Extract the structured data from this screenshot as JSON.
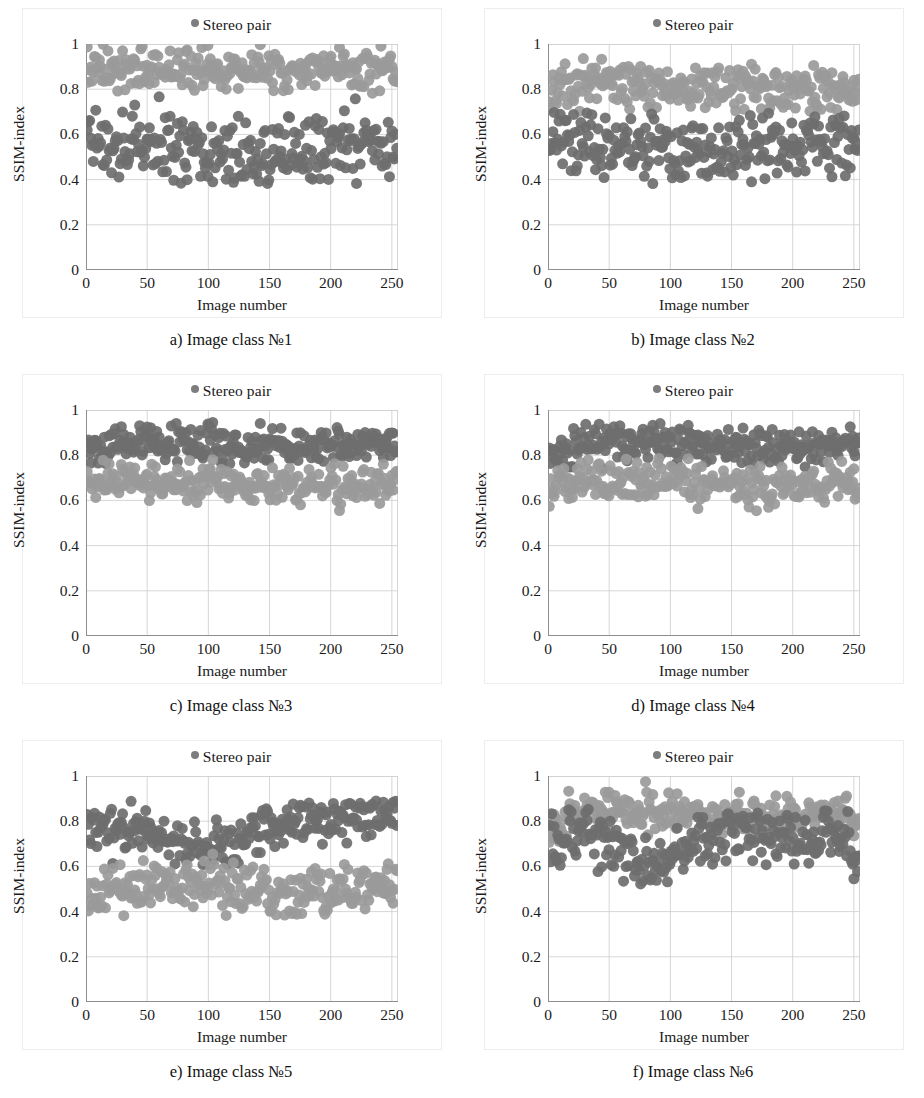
{
  "figure": {
    "panel_count": 6,
    "legend_label": "Stereo pair",
    "legend_marker_color": "#7d7d7d",
    "xlabel": "Image number",
    "ylabel": "SSIM-index",
    "yticks": [
      "0",
      "0.2",
      "0.4",
      "0.6",
      "0.8",
      "1"
    ],
    "xticks": [
      "0",
      "50",
      "100",
      "150",
      "200",
      "250"
    ]
  },
  "panels": [
    {
      "caption": "a) Image class №1",
      "key": "a"
    },
    {
      "caption": "b) Image class №2",
      "key": "b"
    },
    {
      "caption": "c) Image class №3",
      "key": "c"
    },
    {
      "caption": "d) Image class №4",
      "key": "d"
    },
    {
      "caption": "e) Image class №5",
      "key": "e"
    },
    {
      "caption": "f) Image class №6",
      "key": "f"
    }
  ],
  "chart_data": [
    {
      "type": "scatter",
      "title": "a) Image class №1",
      "xlabel": "Image number",
      "ylabel": "SSIM-index",
      "xlim": [
        0,
        255
      ],
      "ylim": [
        0,
        1
      ],
      "xticks": [
        0,
        50,
        100,
        150,
        200,
        250
      ],
      "yticks": [
        0,
        0.2,
        0.4,
        0.6,
        0.8,
        1
      ],
      "grid": true,
      "legend": {
        "entries": [
          "Stereo pair"
        ],
        "position": "top-center"
      },
      "n_points": 255,
      "marker": {
        "shape": "circle",
        "size_px": 11,
        "color": "#8a8a8a"
      },
      "bands": [
        {
          "name": "upper",
          "color": "#9a9a9a",
          "mean": 0.89,
          "spread": 0.045,
          "min": 0.78,
          "max": 1.0
        },
        {
          "name": "lower",
          "color": "#6e6e6e",
          "mean": 0.55,
          "spread": 0.075,
          "min": 0.38,
          "max": 0.78
        }
      ],
      "notes": "Upper band tight near 0.88-0.92; lower band broad 0.40-0.70 with outliers near 0.39"
    },
    {
      "type": "scatter",
      "title": "b) Image class №2",
      "xlabel": "Image number",
      "ylabel": "SSIM-index",
      "xlim": [
        0,
        255
      ],
      "ylim": [
        0,
        1
      ],
      "xticks": [
        0,
        50,
        100,
        150,
        200,
        250
      ],
      "yticks": [
        0,
        0.2,
        0.4,
        0.6,
        0.8,
        1
      ],
      "grid": true,
      "legend": {
        "entries": [
          "Stereo pair"
        ],
        "position": "top-center"
      },
      "n_points": 255,
      "marker": {
        "shape": "circle",
        "size_px": 11,
        "color": "#8a8a8a"
      },
      "bands": [
        {
          "name": "upper",
          "color": "#9a9a9a",
          "mean": 0.81,
          "spread": 0.05,
          "min": 0.7,
          "max": 0.94
        },
        {
          "name": "lower",
          "color": "#6e6e6e",
          "mean": 0.55,
          "spread": 0.07,
          "min": 0.38,
          "max": 0.7
        }
      ],
      "notes": "Upper band ~0.76-0.88; lower band ~0.44-0.66"
    },
    {
      "type": "scatter",
      "title": "c) Image class №3",
      "xlabel": "Image number",
      "ylabel": "SSIM-index",
      "xlim": [
        0,
        255
      ],
      "ylim": [
        0,
        1
      ],
      "xticks": [
        0,
        50,
        100,
        150,
        200,
        250
      ],
      "yticks": [
        0,
        0.2,
        0.4,
        0.6,
        0.8,
        1
      ],
      "grid": true,
      "legend": {
        "entries": [
          "Stereo pair"
        ],
        "position": "top-center"
      },
      "n_points": 255,
      "marker": {
        "shape": "circle",
        "size_px": 11,
        "color": "#8a8a8a"
      },
      "bands": [
        {
          "name": "upper",
          "color": "#6e6e6e",
          "mean": 0.845,
          "spread": 0.04,
          "min": 0.76,
          "max": 0.95
        },
        {
          "name": "lower",
          "color": "#9a9a9a",
          "mean": 0.675,
          "spread": 0.04,
          "min": 0.55,
          "max": 0.78
        }
      ],
      "notes": "Two adjacent bands, dark upper ~0.80-0.90, light lower ~0.62-0.74"
    },
    {
      "type": "scatter",
      "title": "d) Image class №4",
      "xlabel": "Image number",
      "ylabel": "SSIM-index",
      "xlim": [
        0,
        255
      ],
      "ylim": [
        0,
        1
      ],
      "xticks": [
        0,
        50,
        100,
        150,
        200,
        250
      ],
      "yticks": [
        0,
        0.2,
        0.4,
        0.6,
        0.8,
        1
      ],
      "grid": true,
      "legend": {
        "entries": [
          "Stereo pair"
        ],
        "position": "top-center"
      },
      "n_points": 255,
      "marker": {
        "shape": "circle",
        "size_px": 11,
        "color": "#8a8a8a"
      },
      "bands": [
        {
          "name": "upper",
          "color": "#6e6e6e",
          "mean": 0.85,
          "spread": 0.04,
          "min": 0.74,
          "max": 0.94
        },
        {
          "name": "lower",
          "color": "#9a9a9a",
          "mean": 0.675,
          "spread": 0.045,
          "min": 0.55,
          "max": 0.79
        }
      ],
      "notes": "Similar to panel c, bands overlap slightly; starts lower near x=0"
    },
    {
      "type": "scatter",
      "title": "e) Image class №5",
      "xlabel": "Image number",
      "ylabel": "SSIM-index",
      "xlim": [
        0,
        255
      ],
      "ylim": [
        0,
        1
      ],
      "xticks": [
        0,
        50,
        100,
        150,
        200,
        250
      ],
      "yticks": [
        0,
        0.2,
        0.4,
        0.6,
        0.8,
        1
      ],
      "grid": true,
      "legend": {
        "entries": [
          "Stereo pair"
        ],
        "position": "top-center"
      },
      "n_points": 255,
      "marker": {
        "shape": "circle",
        "size_px": 11,
        "color": "#8a8a8a"
      },
      "bands": [
        {
          "name": "upper",
          "color": "#6e6e6e",
          "mean": 0.77,
          "spread": 0.05,
          "min": 0.6,
          "max": 0.89
        },
        {
          "name": "lower",
          "color": "#9a9a9a",
          "mean": 0.5,
          "spread": 0.055,
          "min": 0.38,
          "max": 0.66
        }
      ],
      "notes": "Upper band dips toward 0.62 between x=60 and x=130, rises to ~0.82 after x=140"
    },
    {
      "type": "scatter",
      "title": "f) Image class №6",
      "xlabel": "Image number",
      "ylabel": "SSIM-index",
      "xlim": [
        0,
        255
      ],
      "ylim": [
        0,
        1
      ],
      "xticks": [
        0,
        50,
        100,
        150,
        200,
        250
      ],
      "yticks": [
        0,
        0.2,
        0.4,
        0.6,
        0.8,
        1
      ],
      "grid": true,
      "legend": {
        "entries": [
          "Stereo pair"
        ],
        "position": "top-center"
      },
      "n_points": 255,
      "marker": {
        "shape": "circle",
        "size_px": 11,
        "color": "#8a8a8a"
      },
      "bands": [
        {
          "name": "upper",
          "color": "#9a9a9a",
          "mean": 0.835,
          "spread": 0.04,
          "min": 0.7,
          "max": 0.98
        },
        {
          "name": "lower",
          "color": "#6e6e6e",
          "mean": 0.755,
          "spread": 0.06,
          "min": 0.52,
          "max": 0.86
        }
      ],
      "notes": "Single merged cloud near 0.8; dark sub-band sags to ~0.55 between x=55 and x=115; drops at x=250"
    }
  ]
}
